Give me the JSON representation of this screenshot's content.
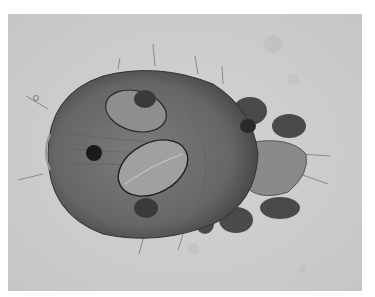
{
  "image": {
    "subject": "mite under light microscope with two eggs",
    "colors": {
      "background": "#cfcfcf",
      "body": "#6e6e6e",
      "body_dark": "#3c3c3c",
      "egg": "#9a9a9a",
      "egg_outline": "#1e1e1e"
    }
  }
}
